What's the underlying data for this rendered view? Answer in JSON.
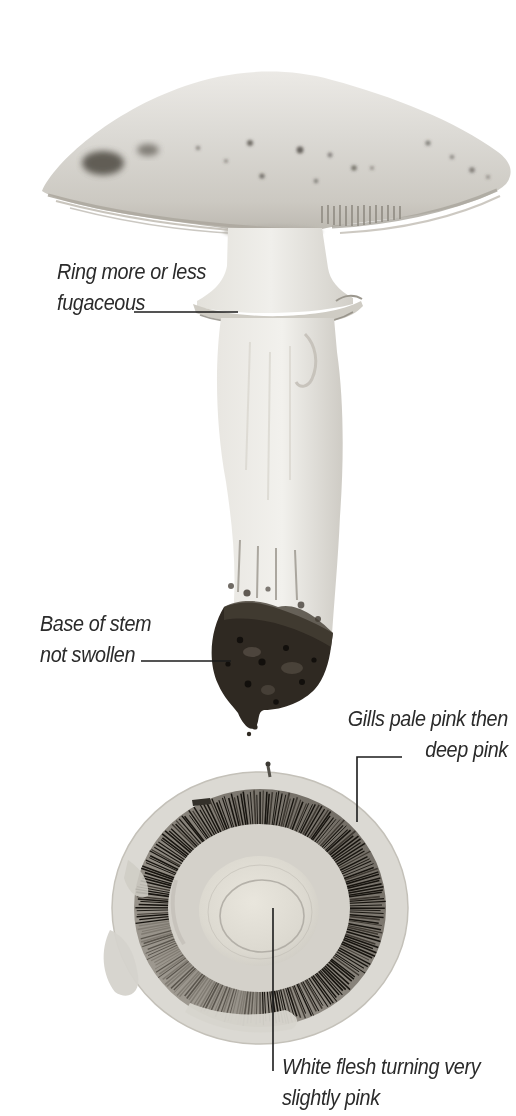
{
  "annotations": {
    "ring": {
      "line1": "Ring more or less",
      "line2": "fugaceous"
    },
    "base": {
      "line1": "Base of stem",
      "line2": "not swollen"
    },
    "gills": {
      "line1": "Gills pale pink then",
      "line2": "deep pink"
    },
    "flesh": {
      "line1": "White flesh turning very",
      "line2": "slightly pink"
    }
  },
  "colors": {
    "background": "#ffffff",
    "label_text": "#2b2b2b",
    "leader_line": "#1b1b1b",
    "cap_light": "#e9e8e4",
    "cap_shadow": "#bdb9b2",
    "stem": "#eceae5",
    "ring_band": "#cfccc4",
    "soil_base": "#2f2922",
    "gill_dark": "#17140f",
    "gill_light": "#807b72",
    "rim_pale": "#dbd9d3",
    "veil_collar": "#d4d1ca",
    "flesh_disc": "#e6e3da"
  }
}
